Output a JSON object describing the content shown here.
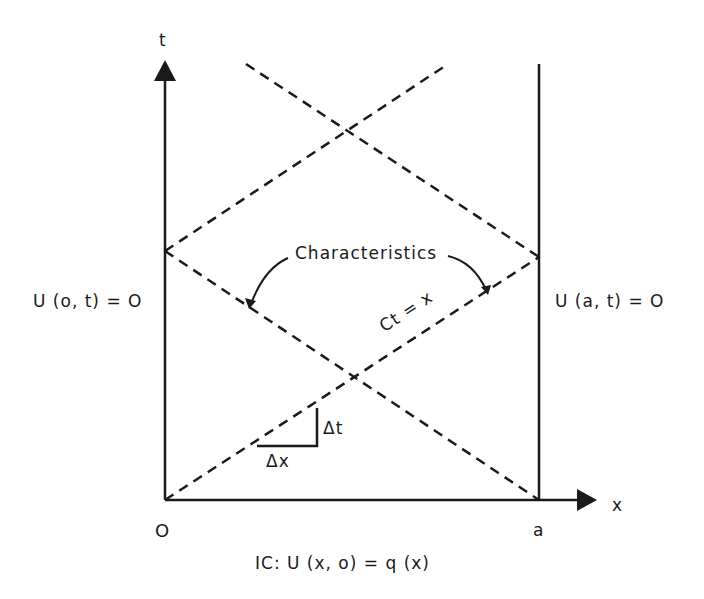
{
  "diagram": {
    "axes": {
      "t_label": "t",
      "x_label": "x",
      "origin_label": "O",
      "a_label": "a"
    },
    "boundary_conditions": {
      "left": "U (o, t) = O",
      "right": "U (a, t) = O"
    },
    "initial_condition": "IC: U (x, o) = q (x)",
    "annotations": {
      "characteristics": "Characteristics",
      "line_equation": "Ct = x",
      "delta_t": "Δt",
      "delta_x": "Δx"
    },
    "colors": {
      "ink": "#1a1a1a",
      "background": "#ffffff"
    }
  }
}
